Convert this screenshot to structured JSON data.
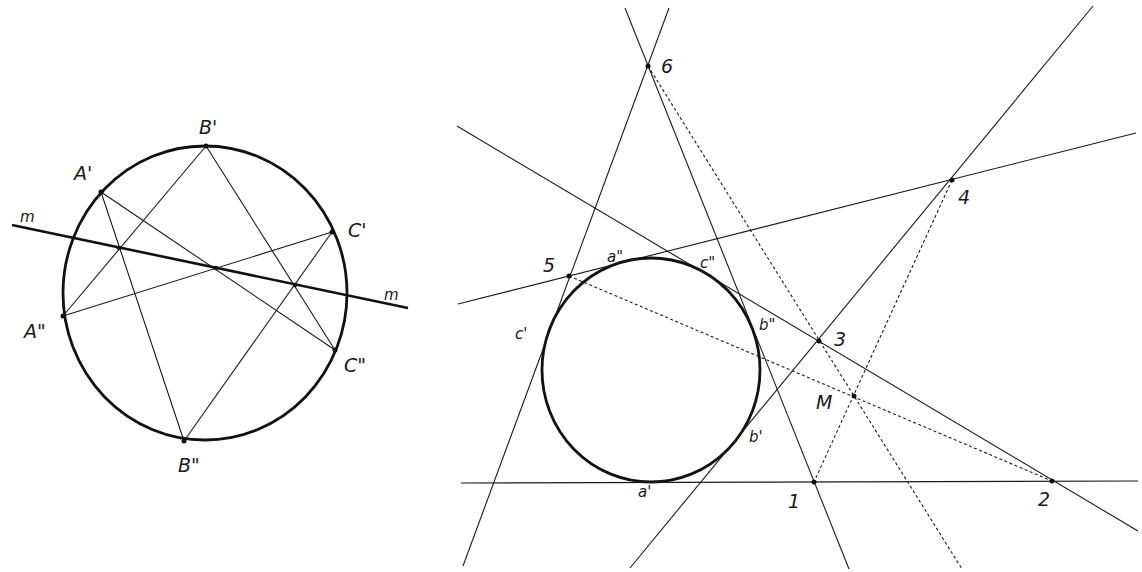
{
  "figure_left": {
    "title": "Circle with three point pairs and axis m",
    "axis_label_start": "m",
    "axis_label_end": "m",
    "points": [
      {
        "id": "A1",
        "label": "A'"
      },
      {
        "id": "A2",
        "label": "A\""
      },
      {
        "id": "B1",
        "label": "B'"
      },
      {
        "id": "B2",
        "label": "B\""
      },
      {
        "id": "C1",
        "label": "C'"
      },
      {
        "id": "C2",
        "label": "C\""
      }
    ]
  },
  "figure_right": {
    "title": "Circle with six tangent lines and Brianchon point",
    "vertex_labels": [
      "1",
      "2",
      "3",
      "4",
      "5",
      "6"
    ],
    "center_label": "M",
    "tangent_point_labels": [
      "a'",
      "a\"",
      "b'",
      "b\"",
      "c'",
      "c\""
    ]
  }
}
